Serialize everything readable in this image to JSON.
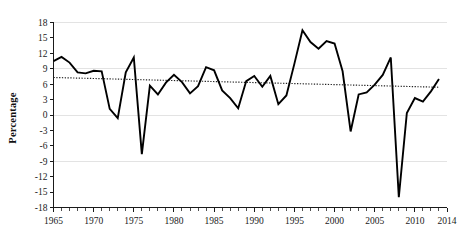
{
  "chart_data": {
    "type": "line",
    "title": "",
    "subtitle": "",
    "xlabel": "",
    "ylabel": "Percentage",
    "xlim": [
      1965,
      2014
    ],
    "ylim": [
      -18,
      18
    ],
    "grid": true,
    "grid_values": [
      18,
      9,
      0,
      -9,
      -18
    ],
    "legend_position": "none",
    "yticks": [
      18,
      15,
      12,
      9,
      6,
      3,
      0,
      -3,
      -6,
      -9,
      -12,
      -15,
      -18
    ],
    "ytick_labels": [
      "18",
      "15",
      "12",
      "9",
      "6",
      "3",
      "0",
      "-3",
      "-6",
      "-9",
      "-12",
      "-15",
      "-18"
    ],
    "xticks": [
      1965,
      1970,
      1975,
      1980,
      1985,
      1990,
      1995,
      2000,
      2005,
      2010,
      2014
    ],
    "xtick_labels": [
      "1965",
      "1970",
      "1975",
      "1980",
      "1985",
      "1990",
      "1995",
      "2000",
      "2005",
      "2010",
      "2014"
    ],
    "x": [
      1965,
      1966,
      1967,
      1968,
      1969,
      1970,
      1971,
      1972,
      1973,
      1974,
      1975,
      1976,
      1977,
      1978,
      1979,
      1980,
      1981,
      1982,
      1983,
      1984,
      1985,
      1986,
      1987,
      1988,
      1989,
      1990,
      1991,
      1992,
      1993,
      1994,
      1995,
      1996,
      1997,
      1998,
      1999,
      2000,
      2001,
      2002,
      2003,
      2004,
      2005,
      2006,
      2007,
      2008,
      2009,
      2010,
      2011,
      2012,
      2013
    ],
    "series": [
      {
        "name": "Percentage",
        "color": "#000000",
        "style": "solid",
        "values": [
          10.5,
          11.3,
          10.2,
          8.3,
          8.1,
          8.6,
          8.5,
          1.2,
          -0.6,
          8.3,
          11.2,
          -7.6,
          5.7,
          4.0,
          6.3,
          7.8,
          6.4,
          4.2,
          5.6,
          9.3,
          8.7,
          4.8,
          3.3,
          1.3,
          6.6,
          7.6,
          5.5,
          7.6,
          2.1,
          3.8,
          10.0,
          16.5,
          14.2,
          12.9,
          14.4,
          13.9,
          8.5,
          -3.2,
          4.0,
          4.4,
          5.9,
          7.8,
          11.2,
          -16.0,
          0.4,
          3.3,
          2.6,
          4.6,
          7.0
        ]
      },
      {
        "name": "Linear trend",
        "color": "#222222",
        "style": "dotted",
        "endpoints": [
          {
            "x": 1965,
            "y": 7.3
          },
          {
            "x": 2013,
            "y": 5.4
          }
        ]
      }
    ]
  }
}
